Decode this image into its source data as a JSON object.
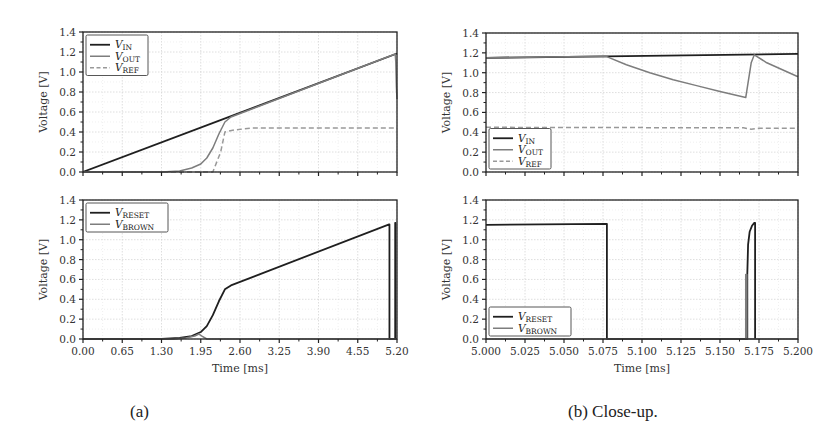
{
  "captions": {
    "a": "(a)",
    "b": "(b) Close-up."
  },
  "colors": {
    "dark": "#1f1f1f",
    "gray": "#7d7d7d",
    "ref": "#999999",
    "grid": "#d6d6d6",
    "axis": "#222222",
    "text": "#333333"
  },
  "chart_data": [
    {
      "id": "a-top",
      "type": "line",
      "panel": "(a)",
      "title": "",
      "xlabel": "",
      "ylabel": "Voltage [V]",
      "xlim": [
        0,
        5.2
      ],
      "ylim": [
        0,
        1.4
      ],
      "xticks": [
        0,
        0.65,
        1.3,
        1.95,
        2.6,
        3.25,
        3.9,
        4.55,
        5.2
      ],
      "xtick_labels": [],
      "yticks": [
        0,
        0.2,
        0.4,
        0.6,
        0.8,
        1.0,
        1.2,
        1.4
      ],
      "ytick_labels": [
        "0.0",
        "0.2",
        "0.4",
        "0.6",
        "0.8",
        "1.0",
        "1.2",
        "1.4"
      ],
      "grid": true,
      "legend_position": "upper left",
      "series": [
        {
          "name": "V_IN",
          "sub": "IN",
          "style": "dark",
          "dash": false,
          "x": [
            0,
            5.2
          ],
          "y": [
            0,
            1.185
          ]
        },
        {
          "name": "V_OUT",
          "sub": "OUT",
          "style": "gray",
          "dash": false,
          "x": [
            0,
            1.3,
            1.6,
            1.8,
            1.95,
            2.05,
            2.15,
            2.25,
            2.35,
            2.45,
            5.17,
            5.18,
            5.19,
            5.2
          ],
          "y": [
            0,
            0.0,
            0.01,
            0.04,
            0.08,
            0.14,
            0.24,
            0.38,
            0.5,
            0.55,
            1.18,
            1.1,
            0.85,
            0.73
          ]
        },
        {
          "name": "V_REF",
          "sub": "REF",
          "style": "ref",
          "dash": true,
          "x": [
            0,
            2.15,
            2.28,
            2.35,
            2.5,
            2.8,
            3.5,
            5.2
          ],
          "y": [
            0,
            0.0,
            0.2,
            0.4,
            0.42,
            0.44,
            0.44,
            0.44
          ]
        }
      ]
    },
    {
      "id": "a-bottom",
      "type": "line",
      "panel": "(a)",
      "title": "",
      "xlabel": "Time [ms]",
      "ylabel": "Voltage [V]",
      "xlim": [
        0,
        5.2
      ],
      "ylim": [
        0,
        1.4
      ],
      "xticks": [
        0,
        0.65,
        1.3,
        1.95,
        2.6,
        3.25,
        3.9,
        4.55,
        5.2
      ],
      "xtick_labels": [
        "0.00",
        "0.65",
        "1.30",
        "1.95",
        "2.60",
        "3.25",
        "3.90",
        "4.55",
        "5.20"
      ],
      "yticks": [
        0,
        0.2,
        0.4,
        0.6,
        0.8,
        1.0,
        1.2,
        1.4
      ],
      "ytick_labels": [
        "0.0",
        "0.2",
        "0.4",
        "0.6",
        "0.8",
        "1.0",
        "1.2",
        "1.4"
      ],
      "grid": true,
      "legend_position": "upper left",
      "series": [
        {
          "name": "V_RESET",
          "sub": "RESET",
          "style": "dark",
          "dash": false,
          "x": [
            0,
            1.3,
            1.6,
            1.8,
            1.95,
            2.05,
            2.15,
            2.25,
            2.35,
            2.45,
            5.07,
            5.075,
            5.075,
            5.17,
            5.17,
            5.175,
            5.175
          ],
          "y": [
            0,
            0.0,
            0.01,
            0.03,
            0.07,
            0.13,
            0.24,
            0.38,
            0.5,
            0.54,
            1.155,
            1.155,
            0.0,
            0.0,
            1.17,
            1.17,
            0.0
          ]
        },
        {
          "name": "V_BROWN",
          "sub": "BROWN",
          "style": "gray",
          "dash": false,
          "x": [
            0,
            1.5,
            1.7,
            1.85,
            1.92,
            1.97,
            2.05,
            2.2,
            5.2
          ],
          "y": [
            0,
            0.0,
            0.01,
            0.03,
            0.05,
            0.03,
            0.0,
            0.0,
            0.0
          ]
        }
      ]
    },
    {
      "id": "b-top",
      "type": "line",
      "panel": "(b) Close-up.",
      "title": "",
      "xlabel": "",
      "ylabel": "Voltage [V]",
      "xlim": [
        5.0,
        5.2
      ],
      "ylim": [
        0,
        1.4
      ],
      "xticks": [
        5.0,
        5.025,
        5.05,
        5.075,
        5.1,
        5.125,
        5.15,
        5.175,
        5.2
      ],
      "xtick_labels": [],
      "yticks": [
        0,
        0.2,
        0.4,
        0.6,
        0.8,
        1.0,
        1.2,
        1.4
      ],
      "ytick_labels": [
        "0.0",
        "0.2",
        "0.4",
        "0.6",
        "0.8",
        "1.0",
        "1.2",
        "1.4"
      ],
      "grid": true,
      "legend_position": "lower left",
      "series": [
        {
          "name": "V_IN",
          "sub": "IN",
          "style": "dark",
          "dash": false,
          "x": [
            5.0,
            5.2
          ],
          "y": [
            1.15,
            1.19
          ]
        },
        {
          "name": "V_OUT",
          "sub": "OUT",
          "style": "gray",
          "dash": false,
          "x": [
            5.0,
            5.077,
            5.09,
            5.105,
            5.12,
            5.135,
            5.15,
            5.1665,
            5.168,
            5.17,
            5.172,
            5.18,
            5.19,
            5.2
          ],
          "y": [
            1.15,
            1.165,
            1.08,
            1.0,
            0.93,
            0.87,
            0.81,
            0.75,
            0.9,
            1.1,
            1.18,
            1.1,
            1.03,
            0.96
          ]
        },
        {
          "name": "V_REF",
          "sub": "REF",
          "style": "ref",
          "dash": true,
          "x": [
            5.0,
            5.165,
            5.17,
            5.175,
            5.2
          ],
          "y": [
            0.45,
            0.445,
            0.43,
            0.44,
            0.44
          ]
        }
      ]
    },
    {
      "id": "b-bottom",
      "type": "line",
      "panel": "(b) Close-up.",
      "title": "",
      "xlabel": "Time [ms]",
      "ylabel": "Voltage [V]",
      "xlim": [
        5.0,
        5.2
      ],
      "ylim": [
        0,
        1.4
      ],
      "xticks": [
        5.0,
        5.025,
        5.05,
        5.075,
        5.1,
        5.125,
        5.15,
        5.175,
        5.2
      ],
      "xtick_labels": [
        "5.000",
        "5.025",
        "5.050",
        "5.075",
        "5.100",
        "5.125",
        "5.150",
        "5.175",
        "5.200"
      ],
      "yticks": [
        0,
        0.2,
        0.4,
        0.6,
        0.8,
        1.0,
        1.2,
        1.4
      ],
      "ytick_labels": [
        "0.0",
        "0.2",
        "0.4",
        "0.6",
        "0.8",
        "1.0",
        "1.2",
        "1.4"
      ],
      "grid": true,
      "legend_position": "lower left",
      "series": [
        {
          "name": "V_RESET",
          "sub": "RESET",
          "style": "dark",
          "dash": false,
          "x": [
            5.0,
            5.0775,
            5.0775,
            5.1675,
            5.1675,
            5.168,
            5.169,
            5.1705,
            5.172,
            5.1725,
            5.1725
          ],
          "y": [
            1.15,
            1.16,
            0.0,
            0.0,
            0.65,
            0.95,
            1.08,
            1.14,
            1.17,
            1.17,
            0.0
          ]
        },
        {
          "name": "V_BROWN",
          "sub": "BROWN",
          "style": "gray",
          "dash": false,
          "x": [
            5.0,
            5.1665,
            5.1665,
            5.1672,
            5.1672,
            5.2
          ],
          "y": [
            0.0,
            0.0,
            0.65,
            0.65,
            0.0,
            0.0
          ]
        }
      ]
    }
  ]
}
